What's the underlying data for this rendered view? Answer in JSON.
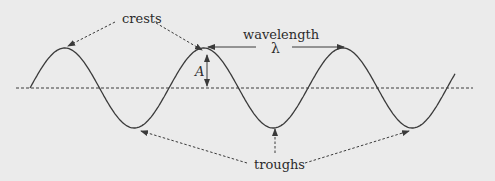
{
  "diagram": {
    "labels": {
      "crests": "crests",
      "troughs": "troughs",
      "wavelength": "wavelength",
      "lambda": "λ",
      "amplitude": "A"
    },
    "colors": {
      "background": "#ebebeb",
      "wave": "#3a3a3a",
      "axis": "#3a3a3a",
      "text": "#2b2b2b"
    },
    "geometry": {
      "axis_y": 88,
      "axis_x_start": 16,
      "axis_x_end": 473,
      "wave_x_start": 30,
      "wave_x_end": 455,
      "amplitude_px": 40,
      "period_px": 139,
      "crest_x": [
        67,
        206,
        345
      ],
      "trough_x": [
        137,
        275,
        415
      ]
    }
  }
}
